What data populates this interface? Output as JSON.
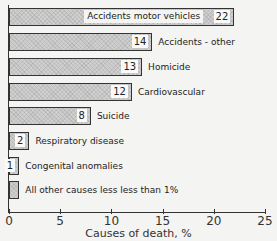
{
  "chart_data": {
    "type": "bar",
    "orientation": "horizontal",
    "title": "",
    "xlabel": "Causes of death, %",
    "ylabel": "",
    "xlim": [
      0,
      25
    ],
    "xticks": [
      "0",
      "5",
      "10",
      "15",
      "20",
      "25"
    ],
    "grid": false,
    "legend": null,
    "categories": [
      "Accidents motor vehicles",
      "Accidents - other",
      "Homicide",
      "Cardiovascular",
      "Suicide",
      "Respiratory disease",
      "Congenital anomalies",
      "All other causes less less than 1%"
    ],
    "values": [
      22,
      14,
      13,
      12,
      8,
      2,
      1,
      1
    ],
    "value_labels": [
      "22",
      "14",
      "13",
      "12",
      "8",
      "2",
      "1",
      ""
    ]
  },
  "bar_color": "#cfcfcf",
  "border_color": "#333333"
}
